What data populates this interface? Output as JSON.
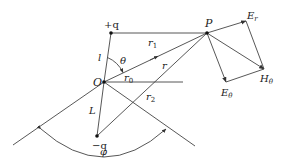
{
  "diagram": {
    "colors": {
      "line": "#444444",
      "text": "#222222",
      "background": "#ffffff"
    },
    "points": {
      "plus_q": {
        "label": "+q",
        "x": 111,
        "y": 33
      },
      "origin": {
        "label": "O",
        "x": 104,
        "y": 82
      },
      "P": {
        "label": "P",
        "x": 207,
        "y": 33
      },
      "minus_q": {
        "label": "−q",
        "x": 97,
        "y": 136
      },
      "E_r_tip": {
        "x": 246,
        "y": 21
      },
      "H_theta_tip": {
        "x": 264,
        "y": 69
      },
      "E_theta_tip": {
        "x": 226,
        "y": 82
      }
    },
    "labels": {
      "plus_q": "+q",
      "origin": "O",
      "P": "P",
      "minus_q": "−q",
      "l": "l",
      "L": "L",
      "theta": "θ",
      "r": "r",
      "r0": "r",
      "r0_sub": "0",
      "r1": "r",
      "r1_sub": "1",
      "r2": "r",
      "r2_sub": "2",
      "E_r": "E",
      "E_r_sub": "r",
      "E_theta": "E",
      "E_theta_sub": "θ",
      "H_theta": "H",
      "H_theta_sub": "θ",
      "phi": "φ"
    }
  }
}
